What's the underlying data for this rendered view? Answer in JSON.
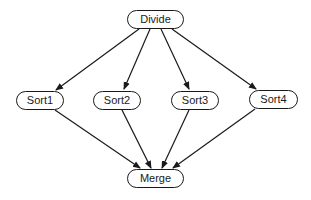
{
  "diagram": {
    "type": "flow",
    "colors": {
      "stroke": "#1a1a1a",
      "node_fill": "#ffffff",
      "background": "#ffffff"
    },
    "nodes": [
      {
        "id": "divide",
        "label": "Divide",
        "x": 127,
        "y": 10,
        "w": 57,
        "h": 19
      },
      {
        "id": "sort1",
        "label": "Sort1",
        "x": 16,
        "y": 91,
        "w": 48,
        "h": 19
      },
      {
        "id": "sort2",
        "label": "Sort2",
        "x": 93,
        "y": 91,
        "w": 48,
        "h": 19
      },
      {
        "id": "sort3",
        "label": "Sort3",
        "x": 171,
        "y": 91,
        "w": 48,
        "h": 19
      },
      {
        "id": "sort4",
        "label": "Sort4",
        "x": 249,
        "y": 90,
        "w": 49,
        "h": 19
      },
      {
        "id": "merge",
        "label": "Merge",
        "x": 127,
        "y": 169,
        "w": 57,
        "h": 19
      }
    ],
    "edges": [
      {
        "from": "divide",
        "to": "sort1",
        "x1": 139,
        "y1": 29,
        "x2": 56,
        "y2": 90
      },
      {
        "from": "divide",
        "to": "sort2",
        "x1": 150,
        "y1": 29,
        "x2": 124,
        "y2": 89
      },
      {
        "from": "divide",
        "to": "sort3",
        "x1": 161,
        "y1": 29,
        "x2": 189,
        "y2": 89
      },
      {
        "from": "divide",
        "to": "sort4",
        "x1": 172,
        "y1": 29,
        "x2": 256,
        "y2": 89
      },
      {
        "from": "sort1",
        "to": "merge",
        "x1": 55,
        "y1": 110,
        "x2": 140,
        "y2": 168
      },
      {
        "from": "sort2",
        "to": "merge",
        "x1": 122,
        "y1": 110,
        "x2": 151,
        "y2": 168
      },
      {
        "from": "sort3",
        "to": "merge",
        "x1": 189,
        "y1": 110,
        "x2": 162,
        "y2": 168
      },
      {
        "from": "sort4",
        "to": "merge",
        "x1": 255,
        "y1": 109,
        "x2": 173,
        "y2": 168
      }
    ]
  }
}
